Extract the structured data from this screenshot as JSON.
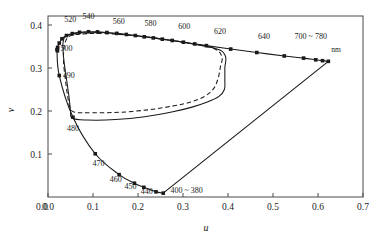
{
  "chart_data": {
    "type": "line",
    "title": "",
    "xlabel": "u",
    "ylabel": "v",
    "xlim": [
      0.0,
      0.7
    ],
    "ylim": [
      0.0,
      0.42
    ],
    "xticks": [
      "0.0",
      "0.1",
      "0.2",
      "0.3",
      "0.4",
      "0.5",
      "0.6",
      "0.7"
    ],
    "xtick_values": [
      0.0,
      0.1,
      0.2,
      0.3,
      0.4,
      0.5,
      0.6,
      0.7
    ],
    "yticks": [
      "0.1",
      "0.2",
      "0.3",
      "0.4"
    ],
    "ytick_values": [
      0.1,
      0.2,
      0.3,
      0.4
    ],
    "grid": false,
    "legend": "none",
    "annotation_unit": "nm",
    "series": [
      {
        "name": "spectral-locus",
        "style": "solid-with-markers",
        "points": [
          {
            "u": 0.021,
            "v": 0.34,
            "label": "400 ~ 380"
          },
          {
            "u": 0.0215,
            "v": 0.348,
            "label": "500"
          },
          {
            "u": 0.025,
            "v": 0.358,
            "label": ""
          },
          {
            "u": 0.031,
            "v": 0.368,
            "label": ""
          },
          {
            "u": 0.041,
            "v": 0.3755,
            "label": "520"
          },
          {
            "u": 0.054,
            "v": 0.38,
            "label": ""
          },
          {
            "u": 0.07,
            "v": 0.383,
            "label": ""
          },
          {
            "u": 0.09,
            "v": 0.3843,
            "label": "540"
          },
          {
            "u": 0.11,
            "v": 0.384,
            "label": ""
          },
          {
            "u": 0.131,
            "v": 0.3825,
            "label": ""
          },
          {
            "u": 0.153,
            "v": 0.3805,
            "label": "560"
          },
          {
            "u": 0.174,
            "v": 0.378,
            "label": ""
          },
          {
            "u": 0.194,
            "v": 0.3755,
            "label": ""
          },
          {
            "u": 0.214,
            "v": 0.3725,
            "label": "580"
          },
          {
            "u": 0.234,
            "v": 0.37,
            "label": ""
          },
          {
            "u": 0.254,
            "v": 0.367,
            "label": ""
          },
          {
            "u": 0.276,
            "v": 0.364,
            "label": "600"
          },
          {
            "u": 0.301,
            "v": 0.36,
            "label": ""
          },
          {
            "u": 0.326,
            "v": 0.356,
            "label": ""
          },
          {
            "u": 0.352,
            "v": 0.352,
            "label": "620"
          },
          {
            "u": 0.406,
            "v": 0.344,
            "label": ""
          },
          {
            "u": 0.464,
            "v": 0.336,
            "label": "640"
          },
          {
            "u": 0.525,
            "v": 0.328,
            "label": ""
          },
          {
            "u": 0.568,
            "v": 0.323,
            "label": ""
          },
          {
            "u": 0.595,
            "v": 0.319,
            "label": ""
          },
          {
            "u": 0.61,
            "v": 0.317,
            "label": "700 ~ 780"
          },
          {
            "u": 0.623,
            "v": 0.3155,
            "label": ""
          }
        ],
        "lower_branch": [
          {
            "u": 0.02,
            "v": 0.343,
            "label": ""
          },
          {
            "u": 0.025,
            "v": 0.2825,
            "label": "490"
          },
          {
            "u": 0.0555,
            "v": 0.1855,
            "label": "480"
          },
          {
            "u": 0.105,
            "v": 0.1005,
            "label": "470"
          },
          {
            "u": 0.158,
            "v": 0.052,
            "label": "460"
          },
          {
            "u": 0.192,
            "v": 0.032,
            "label": "450"
          },
          {
            "u": 0.213,
            "v": 0.0225,
            "label": "440"
          },
          {
            "u": 0.24,
            "v": 0.012,
            "label": ""
          },
          {
            "u": 0.256,
            "v": 0.009,
            "label": ""
          }
        ]
      },
      {
        "name": "purple-line",
        "style": "solid",
        "from": {
          "u": 0.256,
          "v": 0.009
        },
        "to": {
          "u": 0.623,
          "v": 0.3155
        }
      },
      {
        "name": "gamut-solid",
        "style": "solid",
        "points": [
          {
            "u": 0.043,
            "v": 0.376
          },
          {
            "u": 0.036,
            "v": 0.37
          },
          {
            "u": 0.033,
            "v": 0.353
          },
          {
            "u": 0.0355,
            "v": 0.316
          },
          {
            "u": 0.042,
            "v": 0.268
          },
          {
            "u": 0.047,
            "v": 0.23
          },
          {
            "u": 0.05,
            "v": 0.201
          },
          {
            "u": 0.054,
            "v": 0.183
          },
          {
            "u": 0.087,
            "v": 0.179
          },
          {
            "u": 0.15,
            "v": 0.18
          },
          {
            "u": 0.215,
            "v": 0.1865
          },
          {
            "u": 0.275,
            "v": 0.1975
          },
          {
            "u": 0.32,
            "v": 0.209
          },
          {
            "u": 0.354,
            "v": 0.221
          },
          {
            "u": 0.38,
            "v": 0.234
          },
          {
            "u": 0.392,
            "v": 0.25
          },
          {
            "u": 0.393,
            "v": 0.272
          },
          {
            "u": 0.393,
            "v": 0.301
          },
          {
            "u": 0.394,
            "v": 0.328
          },
          {
            "u": 0.37,
            "v": 0.346
          },
          {
            "u": 0.262,
            "v": 0.366
          },
          {
            "u": 0.15,
            "v": 0.38
          },
          {
            "u": 0.08,
            "v": 0.383
          },
          {
            "u": 0.043,
            "v": 0.376
          }
        ]
      },
      {
        "name": "gamut-dashed",
        "style": "dashed",
        "points": [
          {
            "u": 0.056,
            "v": 0.377
          },
          {
            "u": 0.043,
            "v": 0.37
          },
          {
            "u": 0.036,
            "v": 0.35
          },
          {
            "u": 0.0345,
            "v": 0.315
          },
          {
            "u": 0.039,
            "v": 0.27
          },
          {
            "u": 0.044,
            "v": 0.232
          },
          {
            "u": 0.049,
            "v": 0.208
          },
          {
            "u": 0.06,
            "v": 0.197
          },
          {
            "u": 0.098,
            "v": 0.196
          },
          {
            "u": 0.16,
            "v": 0.197
          },
          {
            "u": 0.225,
            "v": 0.203
          },
          {
            "u": 0.28,
            "v": 0.212
          },
          {
            "u": 0.318,
            "v": 0.221
          },
          {
            "u": 0.348,
            "v": 0.234
          },
          {
            "u": 0.368,
            "v": 0.252
          },
          {
            "u": 0.378,
            "v": 0.276
          },
          {
            "u": 0.383,
            "v": 0.302
          },
          {
            "u": 0.386,
            "v": 0.328
          },
          {
            "u": 0.36,
            "v": 0.348
          },
          {
            "u": 0.25,
            "v": 0.368
          },
          {
            "u": 0.145,
            "v": 0.379
          },
          {
            "u": 0.088,
            "v": 0.38
          },
          {
            "u": 0.056,
            "v": 0.377
          }
        ]
      }
    ],
    "wavelength_annotations": [
      {
        "text": "520",
        "u": 0.036,
        "v": 0.408,
        "anchor": "start"
      },
      {
        "text": "540",
        "u": 0.09,
        "v": 0.413,
        "anchor": "middle"
      },
      {
        "text": "560",
        "u": 0.157,
        "v": 0.403,
        "anchor": "middle"
      },
      {
        "text": "580",
        "u": 0.228,
        "v": 0.398,
        "anchor": "middle"
      },
      {
        "text": "600",
        "u": 0.303,
        "v": 0.39,
        "anchor": "middle"
      },
      {
        "text": "620",
        "u": 0.382,
        "v": 0.378,
        "anchor": "middle"
      },
      {
        "text": "640",
        "u": 0.48,
        "v": 0.367,
        "anchor": "middle"
      },
      {
        "text": "700 ~ 780",
        "u": 0.548,
        "v": 0.367,
        "anchor": "start"
      },
      {
        "text": "nm",
        "u": 0.64,
        "v": 0.338,
        "anchor": "middle"
      },
      {
        "text": "500",
        "u": 0.028,
        "v": 0.339,
        "anchor": "start"
      },
      {
        "text": "490",
        "u": 0.033,
        "v": 0.276,
        "anchor": "start"
      },
      {
        "text": "480",
        "u": 0.042,
        "v": 0.154,
        "anchor": "start"
      },
      {
        "text": "470",
        "u": 0.099,
        "v": 0.072,
        "anchor": "start"
      },
      {
        "text": "460",
        "u": 0.137,
        "v": 0.034,
        "anchor": "start"
      },
      {
        "text": "450",
        "u": 0.17,
        "v": 0.019,
        "anchor": "start"
      },
      {
        "text": "440",
        "u": 0.206,
        "v": 0.006,
        "anchor": "start"
      },
      {
        "text": "400 ~ 380",
        "u": 0.272,
        "v": 0.009,
        "anchor": "start"
      }
    ]
  }
}
